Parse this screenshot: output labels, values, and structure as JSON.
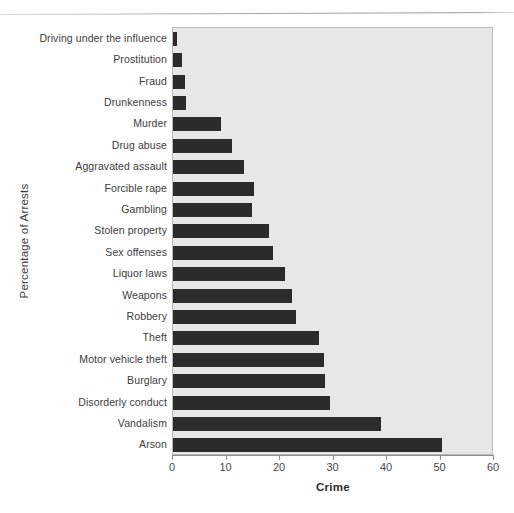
{
  "chart_data": {
    "type": "bar",
    "orientation": "horizontal",
    "title": "",
    "xlabel": "Crime",
    "ylabel": "Percentage of Arrests",
    "xlim": [
      0,
      60
    ],
    "xticks": [
      "0",
      "10",
      "20",
      "30",
      "40",
      "50",
      "60"
    ],
    "grid": false,
    "legend": null,
    "bar_color": "#2b2b2b",
    "plot_background": "#e7e7e7",
    "categories": [
      "Driving under the influence",
      "Prostitution",
      "Fraud",
      "Drunkenness",
      "Murder",
      "Drug abuse",
      "Aggravated assault",
      "Forcible rape",
      "Gambling",
      "Stolen property",
      "Sex offenses",
      "Liquor laws",
      "Weapons",
      "Robbery",
      "Theft",
      "Motor vehicle theft",
      "Burglary",
      "Disorderly conduct",
      "Vandalism",
      "Arson"
    ],
    "values": [
      0.8,
      1.7,
      2.2,
      2.4,
      9.0,
      11.0,
      13.2,
      15.2,
      14.8,
      18.0,
      18.6,
      21.0,
      22.2,
      23.0,
      27.2,
      28.2,
      28.4,
      29.4,
      38.8,
      50.2
    ]
  }
}
